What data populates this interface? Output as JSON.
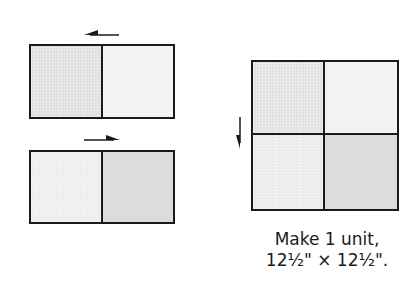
{
  "diagram": {
    "colors": {
      "outline": "#1a1a1a",
      "fabric_medium": "#dcdcdc",
      "fabric_light": "#efefef",
      "fabric_dotted": "#d6d6d6"
    },
    "top_pair": {
      "arrow_direction": "left",
      "units": [
        "medium-gray square",
        "light-gray square"
      ]
    },
    "bottom_pair": {
      "arrow_direction": "right",
      "units": [
        "light-gray square",
        "medium-gray square"
      ]
    },
    "four_patch": {
      "arrow_direction": "down",
      "units": [
        "medium-gray",
        "light-gray",
        "light-gray",
        "medium-gray"
      ]
    },
    "caption": {
      "line1": "Make 1 unit,",
      "line2": "12½\" × 12½\"."
    }
  }
}
